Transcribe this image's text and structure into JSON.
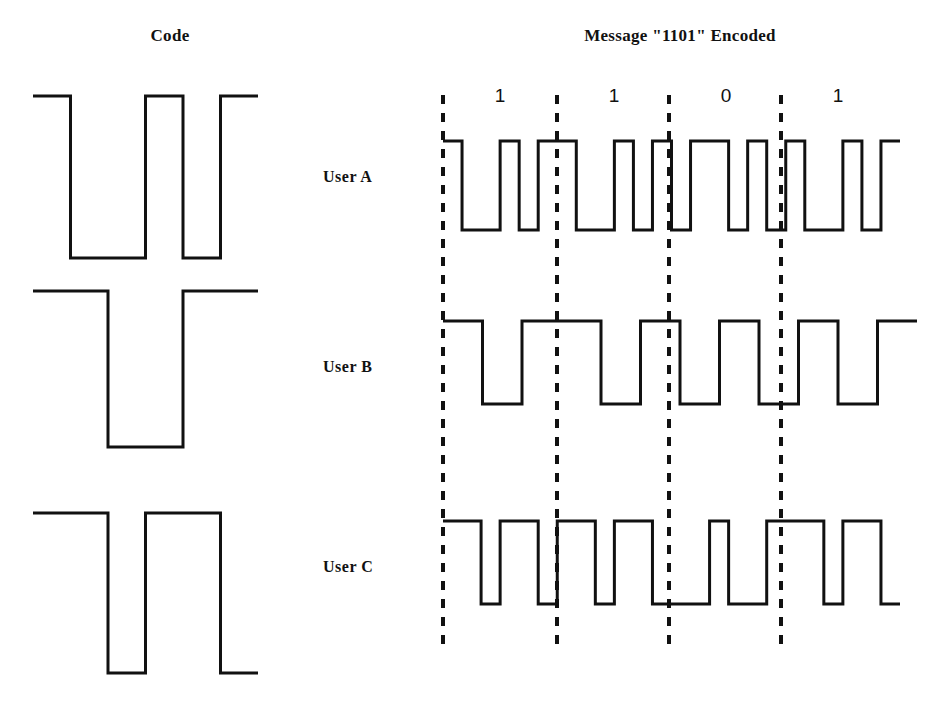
{
  "figure": {
    "kind": "cdma-encoding-diagram",
    "width": 930,
    "height": 710,
    "stroke_color": "#111111",
    "background_color": "#ffffff"
  },
  "headings": {
    "code_title": "Code",
    "message_title": "Message \"1101\" Encoded"
  },
  "message": {
    "bits": [
      "1",
      "1",
      "0",
      "1"
    ],
    "bit_label_positions_x": [
      500,
      614,
      726,
      838
    ],
    "bit_label_y": 85
  },
  "dividers": {
    "x_positions": [
      443,
      557,
      669,
      781
    ],
    "y_top": 95,
    "y_bottom": 645
  },
  "users": [
    {
      "id": "a",
      "label": "User A",
      "code_chips": [
        1,
        0,
        0,
        1,
        0,
        1
      ],
      "encoded_chips": [
        1,
        0,
        0,
        1,
        0,
        1,
        1,
        0,
        0,
        1,
        0,
        1,
        0,
        1,
        1,
        0,
        1,
        0,
        1,
        0,
        0,
        1,
        0,
        1
      ],
      "code_geometry": {
        "x_start": 33,
        "x_end": 258,
        "y_high": 96,
        "y_low": 258
      },
      "encoded_geometry": {
        "x_start": 443,
        "x_end": 900,
        "y_high": 141,
        "y_low": 230
      }
    },
    {
      "id": "b",
      "label": "User B",
      "code_chips": [
        1,
        1,
        0,
        0,
        1,
        1
      ],
      "encoded_chips": [
        1,
        1,
        0,
        0,
        1,
        1,
        1,
        1,
        0,
        0,
        1,
        1,
        0,
        0,
        1,
        1,
        0,
        0,
        1,
        1,
        0,
        0,
        1,
        1
      ],
      "code_geometry": {
        "x_start": 33,
        "x_end": 258,
        "y_high": 291,
        "y_low": 447
      },
      "encoded_geometry": {
        "x_start": 443,
        "x_end": 917,
        "y_high": 321,
        "y_low": 404
      }
    },
    {
      "id": "c",
      "label": "User C",
      "code_chips": [
        1,
        1,
        0,
        1,
        1,
        0
      ],
      "encoded_chips": [
        1,
        1,
        0,
        1,
        1,
        0,
        1,
        1,
        0,
        1,
        1,
        0,
        0,
        0,
        1,
        0,
        0,
        1,
        1,
        1,
        0,
        1,
        1,
        0
      ],
      "code_geometry": {
        "x_start": 33,
        "x_end": 258,
        "y_high": 513,
        "y_low": 673
      },
      "encoded_geometry": {
        "x_start": 443,
        "x_end": 900,
        "y_high": 521,
        "y_low": 604
      }
    }
  ],
  "chart_data": {
    "type": "line",
    "xlabel": "",
    "ylabel": "",
    "codes": {
      "User A": [
        1,
        0,
        0,
        1,
        0,
        1
      ],
      "User B": [
        1,
        1,
        0,
        0,
        1,
        1
      ],
      "User C": [
        1,
        1,
        0,
        1,
        1,
        0
      ]
    },
    "message_bits": [
      1,
      1,
      0,
      1
    ],
    "series": [
      {
        "name": "User A",
        "values": [
          1,
          0,
          0,
          1,
          0,
          1,
          1,
          0,
          0,
          1,
          0,
          1,
          0,
          1,
          1,
          0,
          1,
          0,
          1,
          0,
          0,
          1,
          0,
          1
        ]
      },
      {
        "name": "User B",
        "values": [
          1,
          1,
          0,
          0,
          1,
          1,
          1,
          1,
          0,
          0,
          1,
          1,
          0,
          0,
          1,
          1,
          0,
          0,
          1,
          1,
          0,
          0,
          1,
          1
        ]
      },
      {
        "name": "User C",
        "values": [
          1,
          1,
          0,
          1,
          1,
          0,
          1,
          1,
          0,
          1,
          1,
          0,
          0,
          0,
          1,
          0,
          0,
          1,
          1,
          1,
          0,
          1,
          1,
          0
        ]
      }
    ],
    "legend_position": "left",
    "grid": false,
    "ylim": [
      0,
      1
    ]
  }
}
